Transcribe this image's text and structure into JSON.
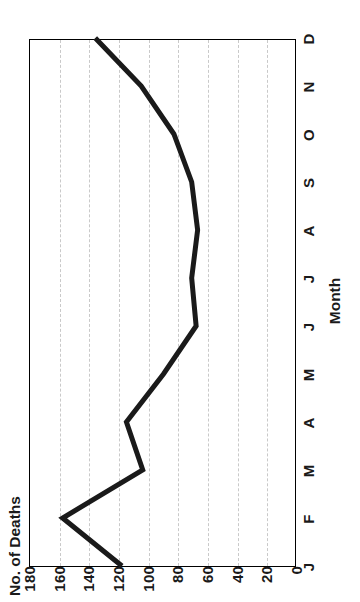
{
  "chart_data": {
    "type": "line",
    "title": "",
    "xlabel": "Month",
    "ylabel": "No. of Deaths",
    "categories": [
      "J",
      "F",
      "M",
      "A",
      "M",
      "J",
      "J",
      "A",
      "S",
      "O",
      "N",
      "D"
    ],
    "values": [
      118,
      158,
      104,
      115,
      90,
      68,
      71,
      67,
      71,
      83,
      105,
      136
    ],
    "series": [
      {
        "name": "No. of Deaths",
        "values": [
          118,
          158,
          104,
          115,
          90,
          68,
          71,
          67,
          71,
          83,
          105,
          136
        ],
        "color": "#1a1a1a",
        "line_width": 5
      }
    ],
    "ylim": [
      0,
      180
    ],
    "yticks": [
      0,
      20,
      40,
      60,
      80,
      100,
      120,
      140,
      160,
      180
    ],
    "ytick_labels": [
      "0",
      "20",
      "40",
      "60",
      "80",
      "100",
      "120",
      "140",
      "160",
      "180"
    ],
    "xtick_labels": [
      "J",
      "F",
      "M",
      "A",
      "M",
      "J",
      "J",
      "A",
      "S",
      "O",
      "N",
      "D"
    ],
    "grid": true,
    "grid_style": "dashed",
    "grid_color": "#c9c9c9",
    "grid_axis": "y",
    "legend": false,
    "legend_position": "none",
    "orientation": "rotated-90-ccw",
    "background": "#ffffff",
    "frame_color": "#000000",
    "markers": false
  },
  "figure": {
    "y_axis_title": "No. of Deaths",
    "x_axis_title": "Month"
  }
}
